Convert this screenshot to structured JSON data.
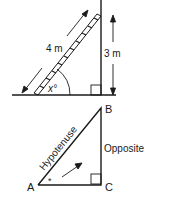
{
  "top_diagram": {
    "ladder_length_label": "4 m",
    "height_label": "3 m",
    "angle_label": "x°"
  },
  "bottom_diagram": {
    "vertex_a": "A",
    "vertex_b": "B",
    "vertex_c": "C",
    "hypotenuse_label": "Hypotenuse",
    "opposite_label": "Opposite",
    "angle_marker": "*"
  },
  "colors": {
    "line": "#1a1a1a",
    "background": "#ffffff"
  }
}
